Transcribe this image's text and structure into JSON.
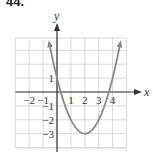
{
  "problem_number": "44.",
  "chart_data": {
    "type": "line",
    "title": "",
    "xlabel": "x",
    "ylabel": "y",
    "function": "y = (x - 2)^2 - 3",
    "vertex": [
      2,
      -3
    ],
    "y_intercept": [
      0,
      1
    ],
    "x_intercepts": [
      0.27,
      3.73
    ],
    "x": [
      -0.6,
      0,
      0.5,
      1,
      1.5,
      2,
      2.5,
      3,
      3.5,
      4,
      4.6
    ],
    "series": [
      {
        "name": "parabola",
        "values": [
          3.76,
          1,
          -0.75,
          -2,
          -2.75,
          -3,
          -2.75,
          -2,
          -0.75,
          1,
          3.76
        ]
      }
    ],
    "xlim": [
      -3,
      5
    ],
    "ylim": [
      -4,
      4
    ],
    "grid": true,
    "x_tick_labels": [
      "−2",
      "−1",
      "1",
      "2",
      "3",
      "4"
    ],
    "x_tick_values": [
      -2,
      -1,
      1,
      2,
      3,
      4
    ],
    "y_tick_labels": [
      "1",
      "−1",
      "−2",
      "−3"
    ],
    "y_tick_values": [
      1,
      -1,
      -2,
      -3
    ],
    "colors": {
      "curve": "#8a8a8a",
      "axis": "#333333",
      "grid": "#d8d8d8"
    }
  }
}
